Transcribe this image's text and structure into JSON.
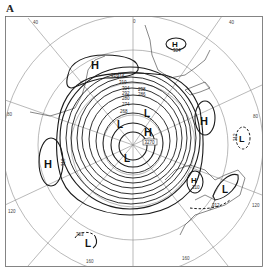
{
  "figure": {
    "panel_label": "A",
    "type": "polar stereographic geopotential height map"
  },
  "longitude_labels": [
    "40",
    "0",
    "40",
    "80",
    "80",
    "120",
    "120",
    "160",
    "160"
  ],
  "pressure_centers": [
    {
      "type": "H",
      "label": "H",
      "value": "316"
    },
    {
      "type": "H",
      "label": "H",
      "value": "304"
    },
    {
      "type": "H",
      "label": "H",
      "value": ""
    },
    {
      "type": "H",
      "label": "H",
      "value": "316"
    },
    {
      "type": "L",
      "label": "L",
      "value": "312"
    },
    {
      "type": "L",
      "label": "L",
      "value": ""
    },
    {
      "type": "L",
      "label": "L",
      "value": ""
    },
    {
      "type": "L",
      "label": "L",
      "value": ""
    },
    {
      "type": "H",
      "label": "H",
      "value": "3270"
    },
    {
      "type": "L",
      "label": "L",
      "value": "303"
    },
    {
      "type": "H",
      "label": "H",
      "value": "310"
    },
    {
      "type": "L",
      "label": "L",
      "value": "312"
    }
  ],
  "contour_labels": [
    "316",
    "310",
    "304",
    "298",
    "292",
    "286",
    "280",
    "274",
    "268"
  ],
  "colors": {
    "ink": "#1a1a1a",
    "grid": "#8a8a8a",
    "background": "#ffffff"
  }
}
